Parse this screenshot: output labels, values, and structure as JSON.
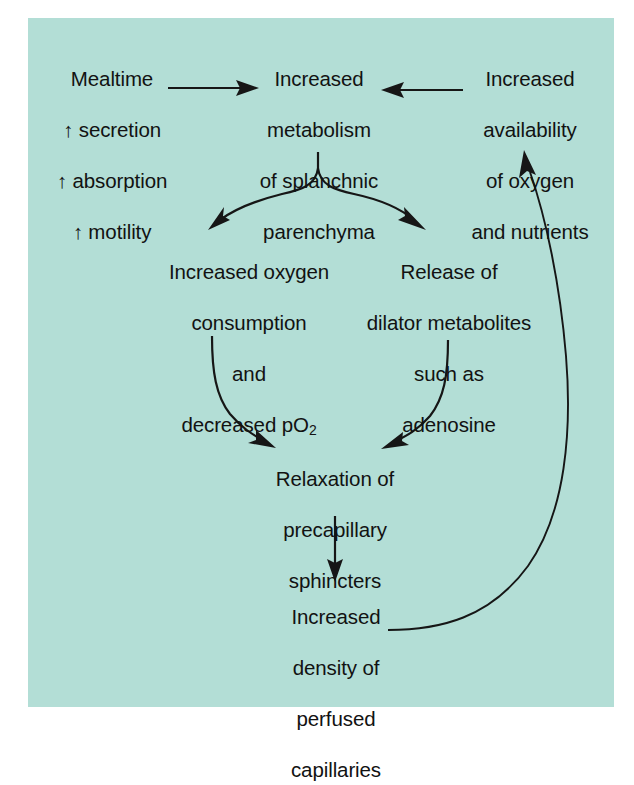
{
  "figure": {
    "panel_color": "#b3ded6",
    "text_color": "#121212",
    "arrow_color": "#161616"
  },
  "nodes": {
    "mealtime": {
      "id": "mealtime",
      "lines": [
        "Mealtime",
        "↑ secretion",
        "↑ absorption",
        "↑ motility"
      ],
      "text": "Mealtime ↑ secretion ↑ absorption ↑ motility"
    },
    "metabolism": {
      "id": "increased-metabolism",
      "lines": [
        "Increased",
        "metabolism",
        "of splanchnic",
        "parenchyma"
      ],
      "text": "Increased metabolism of splanchnic parenchyma"
    },
    "availability": {
      "id": "increased-availability",
      "lines": [
        "Increased",
        "availability",
        "of oxygen",
        "and nutrients"
      ],
      "text": "Increased availability of oxygen and nutrients"
    },
    "oxygen": {
      "id": "increased-oxygen-consumption",
      "lines": [
        "Increased oxygen",
        "consumption",
        "and",
        "decreased pO2"
      ],
      "line4_prefix": "decreased pO",
      "line4_sub": "2",
      "text": "Increased oxygen consumption and decreased pO2"
    },
    "dilator": {
      "id": "release-of-dilator-metabolites",
      "lines": [
        "Release of",
        "dilator metabolites",
        "such as",
        "adenosine"
      ],
      "text": "Release of dilator metabolites such as adenosine"
    },
    "relaxation": {
      "id": "relaxation-of-precapillary-sphincters",
      "lines": [
        "Relaxation of",
        "precapillary",
        "sphincters"
      ],
      "text": "Relaxation of precapillary sphincters"
    },
    "density": {
      "id": "increased-density-of-perfused-capillaries",
      "lines": [
        "Increased",
        "density of",
        "perfused",
        "capillaries"
      ],
      "text": "Increased density of perfused capillaries"
    }
  },
  "connectors": [
    {
      "id": "mealtime-to-metabolism",
      "from": "mealtime",
      "to": "metabolism",
      "style": "straight-horizontal-right"
    },
    {
      "id": "availability-to-metabolism",
      "from": "availability",
      "to": "metabolism",
      "style": "straight-horizontal-left"
    },
    {
      "id": "metabolism-to-oxygen",
      "from": "metabolism",
      "to": "oxygen",
      "style": "curved-fork-left"
    },
    {
      "id": "metabolism-to-dilator",
      "from": "metabolism",
      "to": "dilator",
      "style": "curved-fork-right"
    },
    {
      "id": "oxygen-to-relaxation",
      "from": "oxygen",
      "to": "relaxation",
      "style": "curved-converge-right"
    },
    {
      "id": "dilator-to-relaxation",
      "from": "dilator",
      "to": "relaxation",
      "style": "curved-converge-left"
    },
    {
      "id": "relaxation-to-density",
      "from": "relaxation",
      "to": "density",
      "style": "straight-vertical-down"
    },
    {
      "id": "density-to-availability-feedback",
      "from": "density",
      "to": "availability",
      "style": "long-curved-feedback-loop"
    }
  ]
}
